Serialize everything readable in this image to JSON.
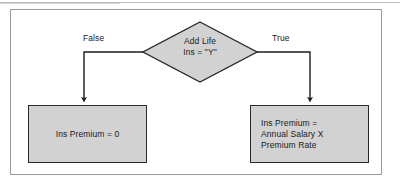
{
  "figure": {
    "type": "flowchart",
    "background_color": "#ffffff",
    "frame_color": "#9a9a9a",
    "node_fill_color": "#d2d2d2",
    "node_border_color": "#2a2a2a",
    "connector_color": "#1b1b1b",
    "text_color": "#1b1b1b"
  },
  "decision": {
    "shape": "diamond",
    "line1": "Add Life",
    "line2": "Ins = \"Y\""
  },
  "branches": {
    "false_label": "False",
    "true_label": "True"
  },
  "boxes": {
    "false_branch": {
      "shape": "process",
      "line1": "Ins Premium = 0"
    },
    "true_branch": {
      "shape": "process",
      "line1": "Ins Premium =",
      "line2": "Annual Salary X",
      "line3": "Premium Rate"
    }
  }
}
